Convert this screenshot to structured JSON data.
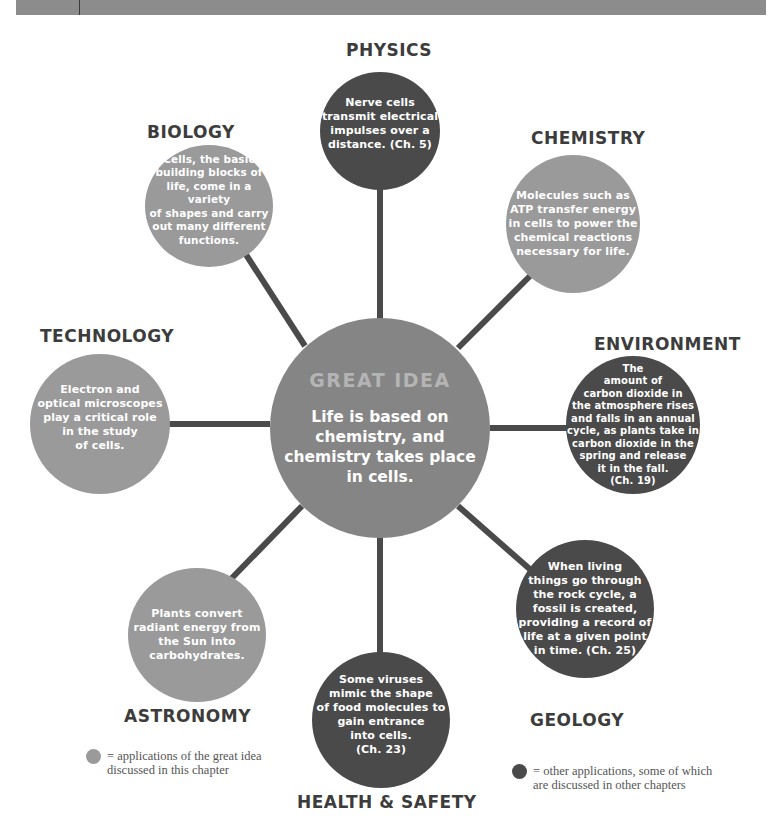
{
  "colors": {
    "top_bar": "#8c8c8c",
    "light_circle": "#9a9a9a",
    "dark_circle": "#4a4a4a",
    "center_circle": "#858585",
    "connector": "#4a4a4a",
    "label_text": "#3c3c3c"
  },
  "center": {
    "title": "GREAT IDEA",
    "text": "Life is based on\nchemistry, and\nchemistry takes place\nin cells."
  },
  "nodes": [
    {
      "id": "physics",
      "label": "PHYSICS",
      "type": "dark",
      "text": "Nerve cells\ntransmit electrical\nimpulses over a\ndistance. (Ch. 5)"
    },
    {
      "id": "chemistry",
      "label": "CHEMISTRY",
      "type": "light",
      "text": "Molecules such as\nATP transfer energy\nin cells to power the\nchemical reactions\nnecessary for life."
    },
    {
      "id": "environment",
      "label": "ENVIRONMENT",
      "type": "dark",
      "text": "The\namount of\ncarbon dioxide in\nthe atmosphere rises\nand falls in an annual\ncycle, as plants take in\ncarbon dioxide in the\nspring and release\nit in the fall.\n(Ch. 19)"
    },
    {
      "id": "geology",
      "label": "GEOLOGY",
      "type": "dark",
      "text": "When living\nthings go through\nthe rock cycle, a\nfossil is created,\nproviding a record of\nlife at a given point\nin time. (Ch. 25)"
    },
    {
      "id": "health_safety",
      "label": "HEALTH & SAFETY",
      "type": "dark",
      "text": "Some viruses\nmimic the shape\nof food molecules to\ngain entrance\ninto cells.\n(Ch. 23)"
    },
    {
      "id": "astronomy",
      "label": "ASTRONOMY",
      "type": "light",
      "text": "Plants convert\nradiant energy from\nthe Sun into\ncarbohydrates."
    },
    {
      "id": "technology",
      "label": "TECHNOLOGY",
      "type": "light",
      "text": "Electron and\noptical microscopes\nplay a critical role\nin the study\nof cells."
    },
    {
      "id": "biology",
      "label": "BIOLOGY",
      "type": "light",
      "text": "Cells, the basic\nbuilding blocks of\nlife, come in a variety\nof shapes and carry\nout many different\nfunctions."
    }
  ],
  "legend": [
    {
      "type": "light",
      "text": "= applications of the great idea\n  discussed in this chapter"
    },
    {
      "type": "dark",
      "text": "= other applications, some of which\n  are discussed in other chapters"
    }
  ]
}
